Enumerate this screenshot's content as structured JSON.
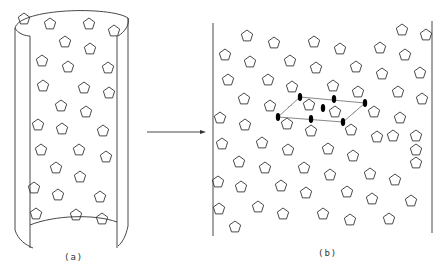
{
  "figure": {
    "panels": [
      {
        "id": "a",
        "label": "(a)",
        "description": "cylinder with pentagons on surface"
      },
      {
        "id": "b",
        "label": "(b)",
        "description": "unrolled plane with pentagons and unit cell parallelogram"
      }
    ],
    "arrow": {
      "from": "a",
      "to": "b"
    },
    "colors": {
      "stroke": "#333333",
      "background": "#ffffff",
      "marker": "#000000"
    },
    "shapes": {
      "motif": "pentagon",
      "marker": "filled-ellipse"
    }
  }
}
